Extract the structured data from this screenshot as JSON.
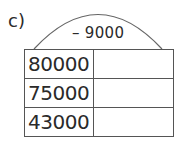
{
  "exercise": {
    "label": "c)",
    "operation": "– 9000",
    "rows": [
      {
        "value": "80000",
        "answer": ""
      },
      {
        "value": "75000",
        "answer": ""
      },
      {
        "value": "43000",
        "answer": ""
      }
    ]
  }
}
